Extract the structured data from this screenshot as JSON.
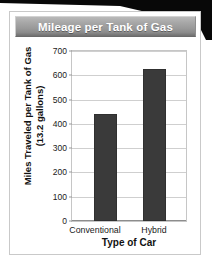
{
  "banner": {
    "title": "Mileage per Tank of Gas"
  },
  "axis": {
    "ylabel_line1": "Miles Traveled per Tank of Gas",
    "ylabel_line2": "(13.2 gallons)",
    "xlabel": "Type of Car"
  },
  "colors": {
    "bar": "#3a3a3a",
    "banner_top": "#b9b9b9",
    "banner_bottom": "#6f6f6f",
    "gridline": "#cfcfcf",
    "card_border": "#c9c9c9"
  },
  "ticks": {
    "t0": "0",
    "t1": "100",
    "t2": "200",
    "t3": "300",
    "t4": "400",
    "t5": "500",
    "t6": "600",
    "t7": "700"
  },
  "categories": {
    "c0": "Conventional",
    "c1": "Hybrid"
  },
  "chart_data": {
    "type": "bar",
    "title": "Mileage per Tank of Gas",
    "xlabel": "Type of Car",
    "ylabel": "Miles Traveled per Tank of Gas (13.2 gallons)",
    "categories": [
      "Conventional",
      "Hybrid"
    ],
    "values": [
      440,
      625
    ],
    "ylim": [
      0,
      700
    ],
    "ytick_values": [
      0,
      100,
      200,
      300,
      400,
      500,
      600,
      700
    ],
    "ytick_step": 100,
    "grid": true,
    "legend": false,
    "bar_color": "#3a3a3a"
  }
}
